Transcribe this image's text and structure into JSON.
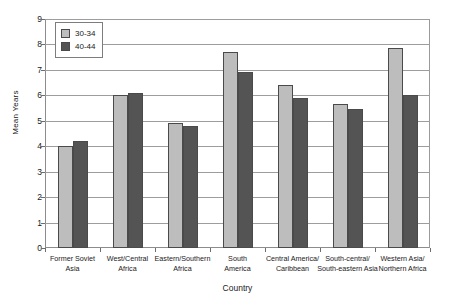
{
  "chart_data": {
    "type": "bar",
    "title": "",
    "xlabel": "Country",
    "ylabel": "Mean Years",
    "ylim": [
      0,
      9
    ],
    "ytick_step": 1,
    "yticks": [
      "9",
      "8",
      "7",
      "6",
      "5",
      "4",
      "3",
      "2",
      "1",
      "0"
    ],
    "grid": true,
    "legend_position": "top-left",
    "categories": [
      "Former Soviet Asia",
      "West/Central Africa",
      "Eastern/Southern Africa",
      "South America",
      "Central America/ Caribbean",
      "South-central/ South-eastern Asia",
      "Western Asia/ Northern Africa"
    ],
    "category_lines": [
      [
        "Former Soviet",
        "Asia"
      ],
      [
        "West/Central",
        "Africa"
      ],
      [
        "Eastern/Southern",
        "Africa"
      ],
      [
        "South",
        "America"
      ],
      [
        "Central America/",
        "Caribbean"
      ],
      [
        "South-central/",
        "South-eastern Asia"
      ],
      [
        "Western Asia/",
        "Northern Africa"
      ]
    ],
    "series": [
      {
        "name": "30-34",
        "color": "#bdbdbd",
        "values": [
          4.0,
          6.0,
          4.9,
          7.7,
          6.4,
          5.65,
          7.85
        ]
      },
      {
        "name": "40-44",
        "color": "#545454",
        "values": [
          4.2,
          6.1,
          4.8,
          6.9,
          5.9,
          5.45,
          6.0
        ]
      }
    ]
  },
  "legend": {
    "entries": [
      {
        "label": "30-34"
      },
      {
        "label": "40-44"
      }
    ]
  },
  "colors": {
    "series_30_34": "#bdbdbd",
    "series_40_44": "#545454",
    "gridline": "#9d9d9d",
    "axis": "#8c8c8c",
    "background": "#ffffff"
  }
}
